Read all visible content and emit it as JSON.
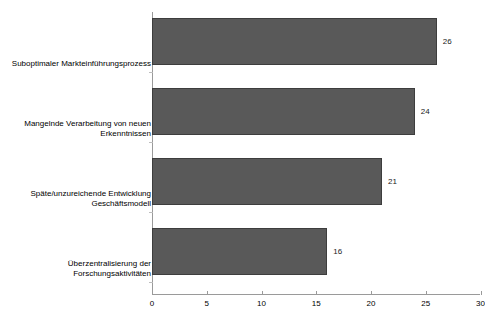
{
  "chart_data": {
    "type": "bar",
    "orientation": "horizontal",
    "title": "",
    "subtitle": "",
    "xlabel": "",
    "ylabel": "",
    "categories": [
      "Suboptimaler Markteinführungsprozess",
      "Mangelnde Verarbeitung von neuen Erkenntnissen",
      "Späte/unzureichende Entwicklung Geschäftsmodell",
      "Überzentralisierung der Forschungsaktivitäten"
    ],
    "category_lines": [
      [
        "Suboptimaler Markteinführungsprozess"
      ],
      [
        "Mangelnde Verarbeitung von neuen",
        "Erkenntnissen"
      ],
      [
        "Späte/unzureichende Entwicklung",
        "Geschäftsmodell"
      ],
      [
        "Überzentralisierung der",
        "Forschungsaktivitäten"
      ]
    ],
    "values": [
      26,
      24,
      21,
      16
    ],
    "data_labels": [
      "26",
      "24",
      "21",
      "16"
    ],
    "xlim": [
      0,
      30
    ],
    "xticks": [
      0,
      5,
      10,
      15,
      20,
      25,
      30
    ],
    "xtick_labels": [
      "0",
      "5",
      "10",
      "15",
      "20",
      "25",
      "30"
    ],
    "grid": false,
    "legend": false,
    "legend_position": "none",
    "colors": {
      "bar_fill": "#595959",
      "bar_border": "#3d3d3d",
      "axis_line": "#9a9a9a",
      "tick_minor": "#bdbdbd",
      "text": "#000000",
      "background": "#ffffff"
    }
  }
}
